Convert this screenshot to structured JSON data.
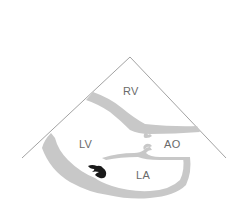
{
  "diagram": {
    "labels": {
      "rv": "RV",
      "lv": "LV",
      "ao": "AO",
      "la": "LA"
    },
    "colors": {
      "background": "#ffffff",
      "sector_outline": "#8a8a8a",
      "tissue": "#c8c8c8",
      "mass": "#1a1a1a",
      "label_text": "#6a6a6a"
    }
  }
}
